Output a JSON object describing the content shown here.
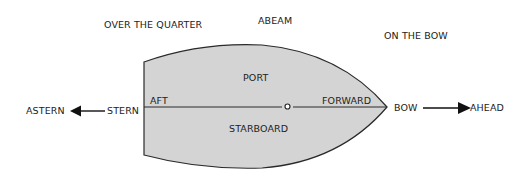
{
  "diagram": {
    "type": "ship-directional-terms",
    "colors": {
      "hull_fill": "#d4d4d4",
      "hull_stroke": "#2a2a2a",
      "text": "#222222",
      "background": "#ffffff"
    },
    "outside_labels": {
      "over_the_quarter": "OVER THE QUARTER",
      "abeam": "ABEAM",
      "on_the_bow": "ON THE BOW",
      "astern": "ASTERN",
      "stern": "STERN",
      "bow": "BOW",
      "ahead": "AHEAD"
    },
    "hull_labels": {
      "port": "PORT",
      "starboard": "STARBOARD",
      "aft": "AFT",
      "forward": "FORWARD"
    },
    "arrows": [
      {
        "name": "astern-arrow",
        "direction": "left"
      },
      {
        "name": "ahead-arrow",
        "direction": "right"
      }
    ]
  }
}
